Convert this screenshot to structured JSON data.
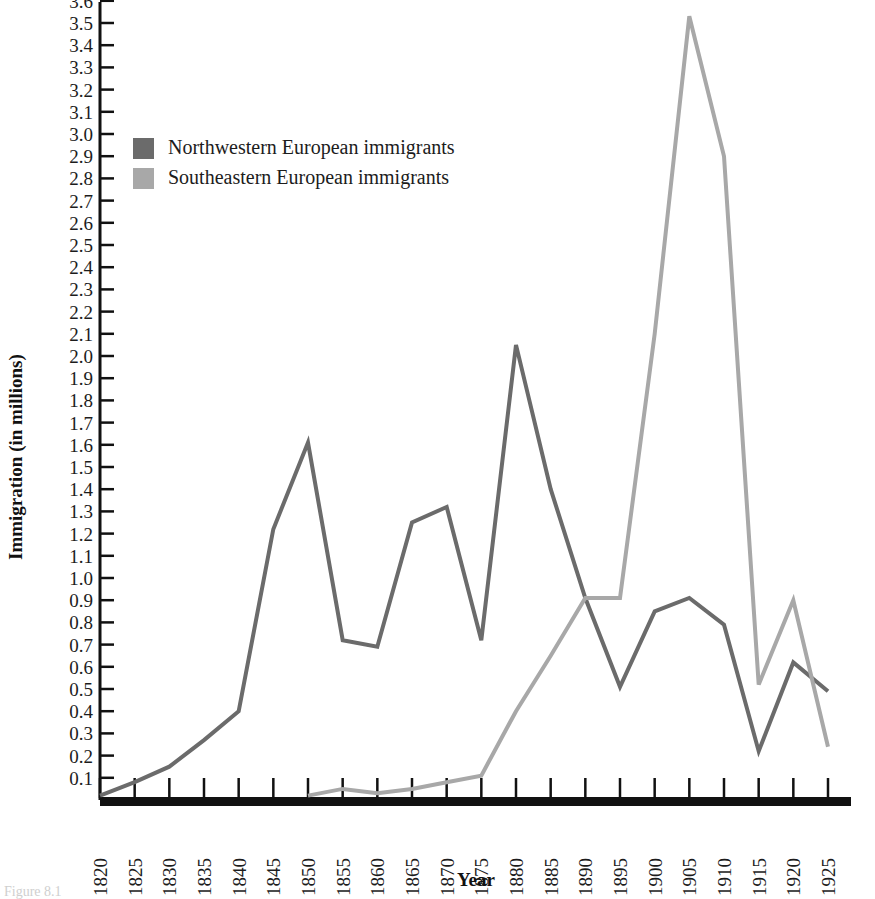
{
  "chart_data": {
    "type": "line",
    "title": "",
    "xlabel": "Year",
    "ylabel": "Immigration (in millions)",
    "xlim": [
      1820,
      1925
    ],
    "ylim": [
      0,
      3.8
    ],
    "grid": false,
    "legend_position": "upper-left",
    "x": [
      1820,
      1825,
      1830,
      1835,
      1840,
      1845,
      1850,
      1855,
      1860,
      1865,
      1870,
      1875,
      1880,
      1885,
      1890,
      1895,
      1900,
      1905,
      1910,
      1915,
      1920,
      1925
    ],
    "categories": [
      "1820",
      "1825",
      "1830",
      "1835",
      "1840",
      "1845",
      "1850",
      "1855",
      "1860",
      "1865",
      "1870",
      "1875",
      "1880",
      "1885",
      "1890",
      "1895",
      "1900",
      "1905",
      "1910",
      "1915",
      "1920",
      "1925"
    ],
    "ytick_labels": [
      "0.1",
      "0.2",
      "0.3",
      "0.4",
      "0.5",
      "0.6",
      "0.7",
      "0.8",
      "0.9",
      "1.0",
      "1.1",
      "1.2",
      "1.3",
      "1.4",
      "1.5",
      "1.6",
      "1.7",
      "1.8",
      "1.9",
      "2.0",
      "2.1",
      "2.2",
      "2.3",
      "2.4",
      "2.5",
      "2.6",
      "2.7",
      "2.8",
      "2.9",
      "3.0",
      "3.1",
      "3.2",
      "3.3",
      "3.4",
      "3.5",
      "3.6",
      "3.7"
    ],
    "ytick_values": [
      0.1,
      0.2,
      0.3,
      0.4,
      0.5,
      0.6,
      0.7,
      0.8,
      0.9,
      1.0,
      1.1,
      1.2,
      1.3,
      1.4,
      1.5,
      1.6,
      1.7,
      1.8,
      1.9,
      2.0,
      2.1,
      2.2,
      2.3,
      2.4,
      2.5,
      2.6,
      2.7,
      2.8,
      2.9,
      3.0,
      3.1,
      3.2,
      3.3,
      3.4,
      3.5,
      3.6,
      3.7
    ],
    "series": [
      {
        "name": "Northwestern European immigrants",
        "color": "#6b6b6b",
        "values": [
          0.02,
          0.08,
          0.15,
          0.27,
          0.4,
          1.22,
          1.61,
          0.72,
          0.69,
          1.25,
          1.32,
          0.72,
          2.05,
          1.4,
          0.91,
          0.51,
          0.85,
          0.91,
          0.79,
          0.22,
          0.62,
          0.49
        ]
      },
      {
        "name": "Southeastern European immigrants",
        "color": "#a8a8a8",
        "values": [
          null,
          null,
          null,
          null,
          null,
          null,
          0.02,
          0.05,
          0.03,
          0.05,
          0.08,
          0.11,
          0.4,
          0.65,
          0.91,
          0.91,
          2.1,
          3.53,
          2.9,
          0.52,
          0.9,
          0.24
        ]
      }
    ]
  },
  "legend": {
    "items": [
      {
        "label": "Northwestern European immigrants",
        "color": "#6b6b6b"
      },
      {
        "label": "Southeastern European immigrants",
        "color": "#a8a8a8"
      }
    ]
  },
  "axes": {
    "y_title": "Immigration (in millions)",
    "x_title": "Year"
  },
  "colors": {
    "axis": "#111111",
    "northwestern": "#6b6b6b",
    "southeastern": "#a8a8a8",
    "background": "#ffffff"
  },
  "caption": {
    "text": "Figure 8.1"
  }
}
